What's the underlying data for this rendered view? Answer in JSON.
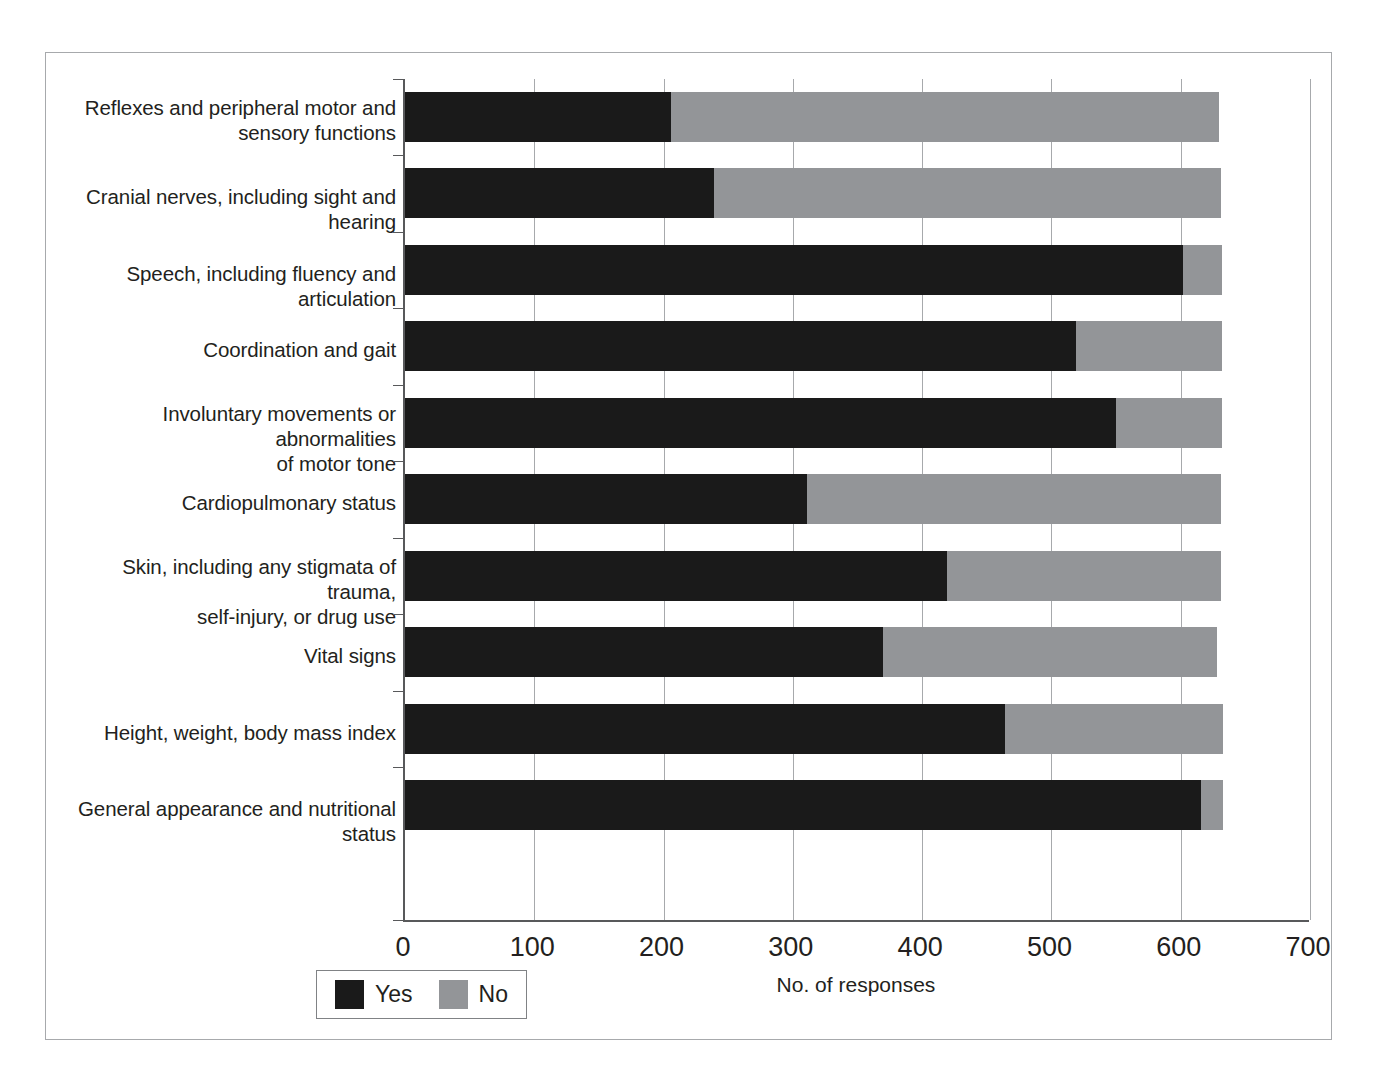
{
  "chart_data": {
    "type": "bar",
    "orientation": "horizontal",
    "stacked": true,
    "title": "",
    "xlabel": "No. of responses",
    "ylabel": "",
    "xlim": [
      0,
      700
    ],
    "xticks": [
      0,
      100,
      200,
      300,
      400,
      500,
      600,
      700
    ],
    "xtick_labels": [
      "0",
      "100",
      "200",
      "300",
      "400",
      "500",
      "600",
      "700"
    ],
    "grid": "vertical",
    "legend_position": "bottom-left",
    "categories": [
      "Reflexes and peripheral motor and sensory functions",
      "Cranial nerves, including sight and hearing",
      "Speech, including fluency and articulation",
      "Coordination and gait",
      "Involuntary movements or abnormalities of motor tone",
      "Cardiopulmonary status",
      "Skin, including any stigmata of trauma, self-injury, or drug use",
      "Vital signs",
      "Height, weight, body mass index",
      "General appearance and nutritional status"
    ],
    "category_lines": [
      [
        "Reflexes and peripheral motor and",
        "sensory functions"
      ],
      [
        "Cranial nerves, including sight and hearing"
      ],
      [
        "Speech, including fluency and articulation"
      ],
      [
        "Coordination and gait"
      ],
      [
        "Involuntary movements or abnormalities",
        "of motor tone"
      ],
      [
        "Cardiopulmonary status"
      ],
      [
        "Skin, including any stigmata of trauma,",
        "self-injury, or drug use"
      ],
      [
        "Vital signs"
      ],
      [
        "Height, weight, body mass index"
      ],
      [
        "General appearance and nutritional status"
      ]
    ],
    "series": [
      {
        "name": "Yes",
        "color": "#1a1a1a",
        "values": [
          206,
          239,
          602,
          519,
          550,
          311,
          419,
          370,
          464,
          616
        ]
      },
      {
        "name": "No",
        "color": "#939598",
        "values": [
          424,
          392,
          30,
          113,
          82,
          320,
          212,
          258,
          169,
          17
        ]
      }
    ],
    "totals": [
      630,
      631,
      632,
      632,
      632,
      631,
      631,
      628,
      633,
      633
    ]
  },
  "legend": {
    "entries": [
      {
        "label": "Yes",
        "color": "#1a1a1a",
        "swatch": "yes-swatch"
      },
      {
        "label": "No",
        "color": "#939598",
        "swatch": "no-swatch"
      }
    ]
  },
  "axis": {
    "x_title": "No. of responses"
  }
}
